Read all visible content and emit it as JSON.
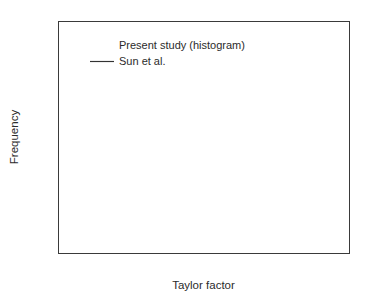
{
  "chart_data": {
    "type": "bar",
    "title": "",
    "xlabel": "Taylor factor",
    "ylabel": "Frequency",
    "xlim": [
      2.0,
      4.0
    ],
    "ylim": [
      0.0,
      0.12
    ],
    "grid": false,
    "legend_position": "top-center",
    "x_ticks": [
      "2.0",
      "2.5",
      "3.0",
      "3.5",
      "4.0"
    ],
    "x_tick_values": [
      2.0,
      2.5,
      3.0,
      3.5,
      4.0
    ],
    "x_minor_tick_values": [
      2.25,
      2.75,
      3.25,
      3.75
    ],
    "y_ticks": [
      "0.00",
      "0.02",
      "0.04",
      "0.06",
      "0.08",
      "0.10",
      "0.12"
    ],
    "y_tick_values": [
      0.0,
      0.02,
      0.04,
      0.06,
      0.08,
      0.1,
      0.12
    ],
    "y_minor_tick_values": [
      0.01,
      0.03,
      0.05,
      0.07,
      0.09,
      0.11
    ],
    "bin_edges": [
      2.35,
      2.45,
      2.55,
      2.65,
      2.75,
      2.85,
      2.95,
      3.05,
      3.15,
      3.25,
      3.35,
      3.45,
      3.55,
      3.65
    ],
    "categories": [
      "2.35-2.45",
      "2.45-2.55",
      "2.55-2.65",
      "2.65-2.75",
      "2.75-2.85",
      "2.85-2.95",
      "2.95-3.05",
      "3.05-3.15",
      "3.15-3.25",
      "3.25-3.35",
      "3.35-3.45",
      "3.45-3.55",
      "3.55-3.65"
    ],
    "values": [
      0.0693,
      0.051,
      0.0693,
      0.0414,
      0.049,
      0.0555,
      0.0714,
      0.0932,
      0.0738,
      0.0897,
      0.0878,
      0.0897,
      0.0854
    ],
    "series": [
      {
        "name": "Present study (histogram)",
        "type": "bar",
        "categories": [
          "2.35-2.45",
          "2.45-2.55",
          "2.55-2.65",
          "2.65-2.75",
          "2.75-2.85",
          "2.85-2.95",
          "2.95-3.05",
          "3.05-3.15",
          "3.15-3.25",
          "3.25-3.35",
          "3.35-3.45",
          "3.45-3.55",
          "3.55-3.65"
        ],
        "values": [
          0.0693,
          0.051,
          0.0693,
          0.0414,
          0.049,
          0.0555,
          0.0714,
          0.0932,
          0.0738,
          0.0897,
          0.0878,
          0.0897,
          0.0854
        ]
      },
      {
        "name": "Sun et al.",
        "type": "line",
        "x": [
          2.3,
          2.38,
          2.46,
          2.54,
          2.62,
          2.7,
          2.75,
          2.8,
          2.86,
          2.92,
          2.98,
          3.04,
          3.1,
          3.16,
          3.22,
          3.26,
          3.32,
          3.38,
          3.44,
          3.5,
          3.56,
          3.62,
          3.68
        ],
        "y": [
          0.0601,
          0.0598,
          0.0586,
          0.0566,
          0.0535,
          0.0501,
          0.0494,
          0.0497,
          0.0515,
          0.0548,
          0.0596,
          0.0665,
          0.0746,
          0.0822,
          0.0878,
          0.0897,
          0.0893,
          0.088,
          0.0868,
          0.0853,
          0.0837,
          0.0826,
          0.082
        ]
      }
    ],
    "legend": [
      {
        "label": "Present study (histogram)",
        "marker": "none"
      },
      {
        "label": "Sun et al.",
        "marker": "line"
      }
    ]
  },
  "axes": {
    "x_title": "Taylor factor",
    "y_title": "Frequency"
  },
  "legend": {
    "entry_0_label": "Present study (histogram)",
    "entry_1_label": "Sun et al."
  },
  "colors": {
    "axis": "#3a3a3a",
    "bar_stroke": "#444444",
    "curve": "#333333",
    "background": "#ffffff",
    "text": "#2b2b2b"
  }
}
